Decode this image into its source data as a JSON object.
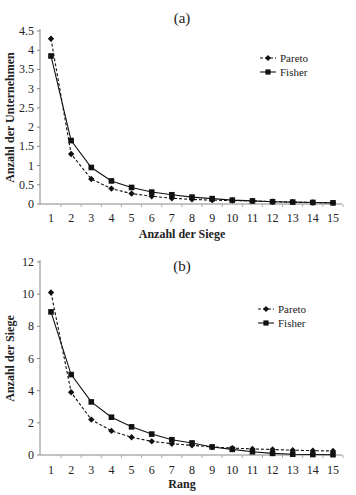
{
  "chart_data": [
    {
      "type": "line",
      "panel_label": "(a)",
      "title": "(a)",
      "xlabel": "Anzahl der Siege",
      "ylabel": "Anzahl der Unternehmen",
      "x": [
        1,
        2,
        3,
        4,
        5,
        6,
        7,
        8,
        9,
        10,
        11,
        12,
        13,
        14,
        15
      ],
      "ylim": [
        0,
        4.5
      ],
      "yticks": [
        "0",
        "0.5",
        "1",
        "1.5",
        "2",
        "2.5",
        "3",
        "3.5",
        "4",
        "4.5"
      ],
      "grid": false,
      "legend_position": "upper right",
      "series": [
        {
          "name": "Pareto",
          "style": "dashed",
          "marker": "diamond",
          "values": [
            4.3,
            1.3,
            0.65,
            0.4,
            0.27,
            0.2,
            0.15,
            0.12,
            0.1,
            0.09,
            0.08,
            0.06,
            0.05,
            0.04,
            0.03
          ]
        },
        {
          "name": "Fisher",
          "style": "solid",
          "marker": "square",
          "values": [
            3.85,
            1.65,
            0.95,
            0.6,
            0.43,
            0.31,
            0.24,
            0.18,
            0.14,
            0.1,
            0.08,
            0.06,
            0.05,
            0.04,
            0.03
          ]
        }
      ]
    },
    {
      "type": "line",
      "panel_label": "(b)",
      "title": "(b)",
      "xlabel": "Rang",
      "ylabel": "Anzahl der Siege",
      "x": [
        1,
        2,
        3,
        4,
        5,
        6,
        7,
        8,
        9,
        10,
        11,
        12,
        13,
        14,
        15
      ],
      "ylim": [
        0,
        12
      ],
      "yticks": [
        "0",
        "2",
        "4",
        "6",
        "8",
        "10",
        "12"
      ],
      "grid": false,
      "legend_position": "upper right",
      "series": [
        {
          "name": "Pareto",
          "style": "dashed",
          "marker": "diamond",
          "values": [
            10.1,
            3.9,
            2.2,
            1.5,
            1.1,
            0.85,
            0.7,
            0.6,
            0.5,
            0.43,
            0.38,
            0.34,
            0.3,
            0.27,
            0.25
          ]
        },
        {
          "name": "Fisher",
          "style": "solid",
          "marker": "square",
          "values": [
            8.9,
            5.0,
            3.3,
            2.35,
            1.75,
            1.3,
            0.95,
            0.75,
            0.5,
            0.35,
            0.2,
            0.1,
            0.05,
            0.03,
            0.02
          ]
        }
      ]
    }
  ]
}
